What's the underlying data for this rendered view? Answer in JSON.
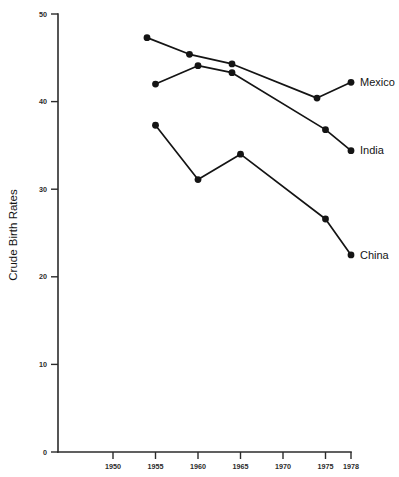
{
  "chart_data": {
    "type": "line",
    "title": "",
    "xlabel": "",
    "ylabel": "Crude Birth Rates",
    "xlim": [
      1946,
      1980
    ],
    "ylim": [
      0,
      50
    ],
    "grid": false,
    "legend_position": "right-end-of-line",
    "y_ticks": [
      0,
      10,
      20,
      30,
      40,
      50
    ],
    "y_tick_labels": [
      "0",
      "10",
      "20",
      "30",
      "40",
      "50"
    ],
    "x_ticks": [
      1950,
      1955,
      1960,
      1965,
      1970,
      1975,
      1978
    ],
    "x_tick_labels": [
      "1950",
      "1955",
      "1960",
      "1965",
      "1970",
      "1975",
      "1978"
    ],
    "marker": "filled-circle",
    "line_color": "#141414",
    "marker_color": "#141414",
    "axis_color": "#2b2b2b",
    "background_color": "#ffffff",
    "series": [
      {
        "name": "Mexico",
        "x": [
          1954,
          1959,
          1964,
          1974,
          1978
        ],
        "values": [
          47.3,
          45.4,
          44.3,
          40.4,
          42.2
        ]
      },
      {
        "name": "India",
        "x": [
          1955,
          1960,
          1964,
          1975,
          1978
        ],
        "values": [
          42.0,
          44.1,
          43.3,
          36.8,
          34.4
        ]
      },
      {
        "name": "China",
        "x": [
          1955,
          1960,
          1965,
          1975,
          1978
        ],
        "values": [
          37.3,
          31.1,
          34.0,
          26.6,
          22.5
        ]
      }
    ]
  }
}
